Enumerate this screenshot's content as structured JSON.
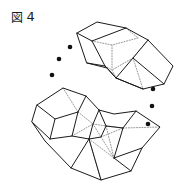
{
  "figure": {
    "caption_cjk": "図",
    "caption_number": "4",
    "caption_full": "図 4",
    "background_color": "#ffffff",
    "line_color": "#1a1a1a",
    "hidden_line_color": "#8d8d8d",
    "dot_color": "#111111",
    "width": 189,
    "height": 185
  },
  "drawing": {
    "type": "technical-line-drawing",
    "description": "Two polyhedral solids drawn in oblique projection with dashed hidden edges, separated by two arcs of three ellipsis dots",
    "objects": [
      {
        "name": "upper-polyhedron",
        "label": "upper wedge solid",
        "visible_outline": "77,33 97,22 126,28 148,40 173,66 164,84 143,89 116,78 107,68 87,63",
        "faces": [
          {
            "name": "upper-top-face",
            "points": "77,33 97,22 126,28 138,38 112,45 92,41"
          },
          {
            "name": "upper-left-face",
            "points": "77,33 92,41 105,66 87,63"
          },
          {
            "name": "upper-front-face",
            "points": "87,63 105,66 112,45 92,41"
          },
          {
            "name": "upper-right-slab-top",
            "points": "126,28 148,40 133,58 112,45"
          },
          {
            "name": "upper-right-slab-face",
            "points": "148,40 173,66 164,84 133,58"
          },
          {
            "name": "upper-right-slab-under",
            "points": "133,58 164,84 143,89 116,78 112,70"
          }
        ],
        "hidden_edges": [
          "112,45 112,70",
          "92,41 112,45",
          "105,66 112,70",
          "112,70 116,78",
          "126,28 138,38",
          "138,38 112,45",
          "133,58 112,70",
          "133,58 143,89",
          "148,40 133,58"
        ]
      },
      {
        "name": "lower-polyhedron-chain",
        "label": "lower curved articulated solid",
        "visible_outline": "37,105 63,88 86,96 99,110 114,114 136,111 160,127 142,148 131,171 101,180 71,168 45,141 32,122",
        "faces": [
          {
            "name": "lower-left-top-face",
            "points": "37,105 63,88 86,96 78,112 55,119"
          },
          {
            "name": "lower-left-front-face",
            "points": "37,105 55,119 50,139 32,122"
          },
          {
            "name": "lower-left-bottom-face",
            "points": "55,119 78,112 72,136 50,139"
          },
          {
            "name": "lower-mid-joint-face",
            "points": "78,112 86,96 99,110 93,124"
          },
          {
            "name": "lower-mid-face",
            "points": "78,112 93,124 89,139 72,136"
          },
          {
            "name": "lower-mid-lower-face",
            "points": "50,139 72,136 89,139 71,168 45,141"
          },
          {
            "name": "lower-right-top-face",
            "points": "99,110 114,114 136,111 123,128 106,126"
          },
          {
            "name": "lower-right-upper-face",
            "points": "93,124 99,110 106,126 101,137"
          },
          {
            "name": "lower-right-front-face",
            "points": "89,139 101,137 106,126 123,128 114,158 101,180"
          },
          {
            "name": "lower-right-slab-face",
            "points": "136,111 160,127 142,148 114,158 123,128"
          },
          {
            "name": "lower-bottom-face",
            "points": "71,168 89,139 101,180"
          }
        ],
        "hidden_edges": [
          "93,124 106,126",
          "106,126 123,128",
          "123,128 160,127",
          "101,137 114,158",
          "89,139 114,158",
          "72,136 93,124",
          "93,124 101,137",
          "101,137 123,128",
          "78,112 93,124",
          "106,126 114,158",
          "63,88 78,112",
          "86,96 78,112",
          "89,139 101,180"
        ]
      }
    ],
    "ellipsis_arcs": [
      {
        "name": "left-ellipsis-arc",
        "dot_count": 3,
        "dots": [
          {
            "cx": 70,
            "cy": 47,
            "r": 2.3
          },
          {
            "cx": 59,
            "cy": 59,
            "r": 2.3
          },
          {
            "cx": 52,
            "cy": 75,
            "r": 2.3
          }
        ]
      },
      {
        "name": "right-ellipsis-arc",
        "dot_count": 3,
        "dots": [
          {
            "cx": 153,
            "cy": 89,
            "r": 2.3
          },
          {
            "cx": 152,
            "cy": 106,
            "r": 2.3
          },
          {
            "cx": 148,
            "cy": 124,
            "r": 2.3
          }
        ]
      }
    ]
  }
}
